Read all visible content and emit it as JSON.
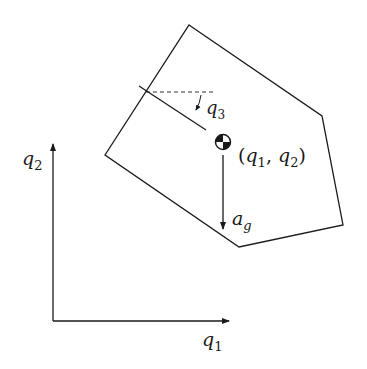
{
  "diagram": {
    "axes": {
      "x_label": "q",
      "x_sub": "1",
      "y_label": "q",
      "y_sub": "2"
    },
    "body": {
      "shape": "pentagon",
      "com_label": "(q1, q2)",
      "com_parts": {
        "open": "(",
        "q": "q",
        "sub1": "1",
        "comma": ", ",
        "sub2": "2",
        "close": ")"
      },
      "angle_label": "q",
      "angle_sub": "3",
      "gravity_label": "a",
      "gravity_sub": "g"
    },
    "colors": {
      "stroke": "#1a1a1a",
      "background": "#ffffff"
    }
  }
}
